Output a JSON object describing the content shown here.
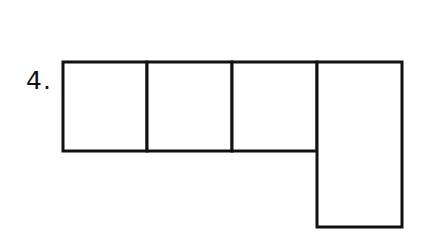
{
  "problem": {
    "number_label": "4."
  },
  "figure": {
    "stroke_color": "#111111",
    "fill_color": "#ffffff",
    "stroke_width": 3,
    "row": {
      "top": 62,
      "bottom": 151,
      "cells": [
        {
          "name": "square-1",
          "x1": 63,
          "x2": 147
        },
        {
          "name": "square-2",
          "x1": 147,
          "x2": 232
        },
        {
          "name": "square-3",
          "x1": 232,
          "x2": 317
        }
      ]
    },
    "tall_rect": {
      "name": "tall-rectangle",
      "x1": 317,
      "x2": 402,
      "top": 62,
      "bottom": 227
    }
  }
}
